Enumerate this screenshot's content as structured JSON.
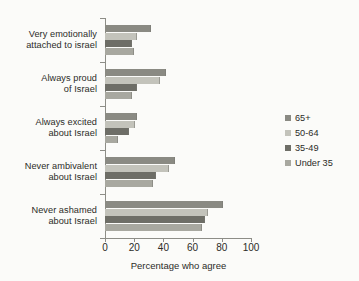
{
  "chart_data": {
    "type": "bar",
    "orientation": "horizontal",
    "title": "",
    "xlabel": "Percentage who agree",
    "ylabel": "",
    "xlim": [
      0,
      100
    ],
    "xticks": [
      0,
      20,
      40,
      60,
      80,
      100
    ],
    "xtick_labels": [
      "0",
      "20",
      "40",
      "60",
      "80",
      "100"
    ],
    "grid": false,
    "legend_position": "right",
    "categories": [
      "Very emotionally attached to israel",
      "Always proud of Israel",
      "Always excited about Israel",
      "Never ambivalent about Israel",
      "Never ashamed about Israel"
    ],
    "category_lines": [
      [
        "Very emotionally",
        "attached to israel"
      ],
      [
        "Always proud",
        "of Israel"
      ],
      [
        "Always excited",
        "about Israel"
      ],
      [
        "Never ambivalent",
        "about Israel"
      ],
      [
        "Never ashamed",
        "about Israel"
      ]
    ],
    "series": [
      {
        "name": "65+",
        "color": "#8a8a83",
        "values": [
          31,
          41,
          21,
          47,
          80
        ]
      },
      {
        "name": "50-64",
        "color": "#c3c3bb",
        "values": [
          21,
          37,
          20,
          43,
          70
        ]
      },
      {
        "name": "35-49",
        "color": "#6e6e67",
        "values": [
          18,
          21,
          16,
          34,
          68
        ]
      },
      {
        "name": "Under 35",
        "color": "#a8a8a0",
        "values": [
          19,
          18,
          8,
          32,
          66
        ]
      }
    ]
  },
  "legend": {
    "items": [
      {
        "label": "65+",
        "color": "#8a8a83"
      },
      {
        "label": "50-64",
        "color": "#c3c3bb"
      },
      {
        "label": "35-49",
        "color": "#6e6e67"
      },
      {
        "label": "Under 35",
        "color": "#a8a8a0"
      }
    ]
  }
}
